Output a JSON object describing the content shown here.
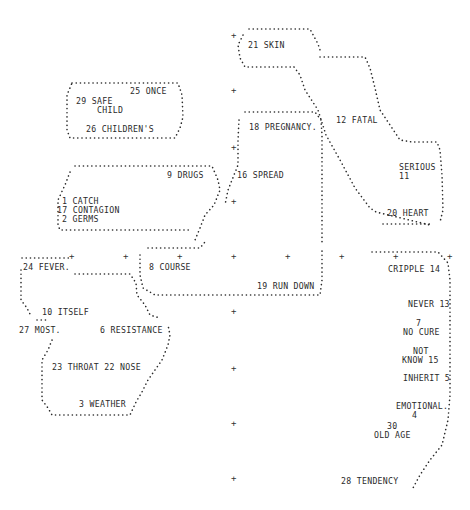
{
  "diagram": {
    "type": "cluster-map",
    "style": "dot-matrix printout",
    "colors": {
      "ink": "#2a2a2a",
      "background": "#ffffff"
    },
    "clusters": [
      {
        "id": "skin-group",
        "labels": [
          "21 SKIN"
        ]
      },
      {
        "id": "fatal-serious-heart",
        "labels": [
          "12 FATAL",
          "SERIOUS",
          "11",
          "20 HEART"
        ]
      },
      {
        "id": "once-safe-children",
        "labels": [
          "25 ONCE",
          "29 SAFE",
          "CHILD",
          "26 CHILDREN'S"
        ]
      },
      {
        "id": "pregnancy-spread",
        "labels": [
          "18 PREGNANCY.",
          "16 SPREAD"
        ]
      },
      {
        "id": "catch-contagion-germs-drugs",
        "labels": [
          "9 DRUGS",
          "1 CATCH",
          "17 CONTAGION",
          "2 GERMS"
        ]
      },
      {
        "id": "course-rundown",
        "labels": [
          "8 COURSE",
          "19 RUN DOWN"
        ]
      },
      {
        "id": "fever-itself",
        "labels": [
          "24 FEVER.",
          "10 ITSELF"
        ]
      },
      {
        "id": "resistance-throat-weather",
        "labels": [
          "27 MOST.",
          "6 RESISTANCE",
          "23 THROAT 22 NOSE",
          "3 WEATHER"
        ]
      },
      {
        "id": "cripple-tendency",
        "labels": [
          "CRIPPLE 14",
          "NEVER 13",
          "7",
          "NO CURE",
          "NOT",
          "KNOW 15",
          "INHERIT 5",
          "EMOTIONAL.",
          "4",
          "30",
          "OLD AGE",
          "28 TENDENCY"
        ]
      }
    ],
    "labels": {
      "skin": "21 SKIN",
      "fatal": "12 FATAL",
      "serious": "SERIOUS",
      "serious_num": "11",
      "heart": "20 HEART",
      "once": "25 ONCE",
      "safe": "29 SAFE",
      "child": "CHILD",
      "childrens": "26 CHILDREN'S",
      "pregnancy": "18 PREGNANCY.",
      "spread": "16 SPREAD",
      "drugs": "9 DRUGS",
      "catch": "1 CATCH",
      "contagion": "17 CONTAGION",
      "germs": "2 GERMS",
      "fever": "24 FEVER.",
      "course": "8 COURSE",
      "rundown": "19 RUN DOWN",
      "itself": "10 ITSELF",
      "most": "27 MOST.",
      "resistance": "6 RESISTANCE",
      "throat_nose": "23 THROAT 22 NOSE",
      "weather": "3 WEATHER",
      "cripple": "CRIPPLE 14",
      "never": "NEVER 13",
      "nocure_num": "7",
      "nocure": "NO CURE",
      "not": "NOT",
      "know": "KNOW 15",
      "inherit": "INHERIT 5",
      "emotional": "EMOTIONAL.",
      "emotional_num": "4",
      "oldage_num": "30",
      "oldage": "OLD AGE",
      "tendency": "28 TENDENCY"
    },
    "grid_marker": "+"
  }
}
